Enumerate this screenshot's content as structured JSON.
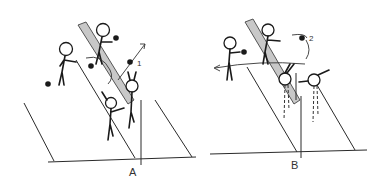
{
  "figure": {
    "panels": [
      {
        "id": "A",
        "label": "A",
        "annotation": "1"
      },
      {
        "id": "B",
        "label": "B",
        "annotation": "2"
      }
    ]
  },
  "colors": {
    "ink": "#1a1a1a",
    "shade": "#c8c8c8",
    "background": "#ffffff"
  }
}
